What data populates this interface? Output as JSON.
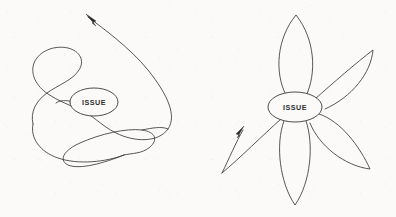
{
  "canvas": {
    "width": 396,
    "height": 217,
    "background_color": "#fbfaf8",
    "ink_color": "#3a3a3c"
  },
  "diagrams": [
    {
      "id": "tangled-scribble-diagram",
      "name": "left-diagram",
      "description": "Hand-drawn tangled looping line passing through a central ISSUE node, ending in an arrow at the upper left",
      "node": {
        "label": "ISSUE",
        "shape": "ellipse",
        "cx": 94,
        "cy": 102,
        "rx": 24,
        "ry": 14
      },
      "arrow": {
        "name": "arrowhead-up-left",
        "tip_x": 86,
        "tip_y": 14,
        "direction": "up-left"
      },
      "path": "M 86 15 C 100 26 128 44 146 66 C 166 90 176 112 168 126 C 160 140 136 140 120 132 C 104 124 96 112 84 108 C 68 102 52 108 44 120 C 34 134 40 150 54 160 C 70 171 96 174 114 168 C 131 162 138 152 134 143 C 130 133 116 128 98 127 C 78 126 60 131 52 140 C 42 151 48 161 62 165 C 78 170 104 167 124 158 C 146 148 162 133 166 120 C 170 106 160 98 146 99 C 133 100 124 108 118 102 C 112 96 118 88 112 84 C 104 79 92 88 82 94 C 70 101 58 104 48 100 C 36 95 30 84 32 72 C 34 58 44 46 58 40 C 72 34 86 36 92 44 C 98 53 92 64 80 72 C 66 81 50 88 40 98 C 31 107 30 118 34 128"
    },
    {
      "id": "flower-petal-diagram",
      "name": "right-diagram",
      "description": "Hand-drawn five-petal flower radiating from a central ISSUE node, with one open petal at lower left ending in an arrow",
      "node": {
        "label": "ISSUE",
        "shape": "ellipse",
        "cx": 295,
        "cy": 107,
        "rx": 27,
        "ry": 15
      },
      "arrow": {
        "name": "arrowhead-up-right",
        "tip_x": 243,
        "tip_y": 127,
        "direction": "up-right"
      },
      "petals": [
        {
          "name": "petal-top",
          "tip_x": 296,
          "tip_y": 15,
          "closed": true
        },
        {
          "name": "petal-upper-right",
          "tip_x": 372,
          "tip_y": 50,
          "closed": true
        },
        {
          "name": "petal-lower-right",
          "tip_x": 370,
          "tip_y": 168,
          "closed": true
        },
        {
          "name": "petal-bottom",
          "tip_x": 295,
          "tip_y": 205,
          "closed": true
        },
        {
          "name": "petal-lower-left-open",
          "tip_x": 222,
          "tip_y": 172,
          "closed": false
        }
      ],
      "petal_paths": [
        "M 285 96 C 275 74 277 40 296 15 C 314 41 316 74 306 96",
        "M 315 100 C 332 84 356 64 372 50 C 370 72 352 96 326 108",
        "M 318 115 C 340 122 360 148 370 168 C 346 166 320 146 311 124",
        "M 284 121 C 276 144 280 182 295 205 C 311 182 314 144 306 121",
        "M 280 119 C 262 134 240 158 222 172 C 232 160 240 142 244 128"
      ],
      "open_petal_tail": "M 222 172 C 228 160 236 142 244 129"
    }
  ]
}
